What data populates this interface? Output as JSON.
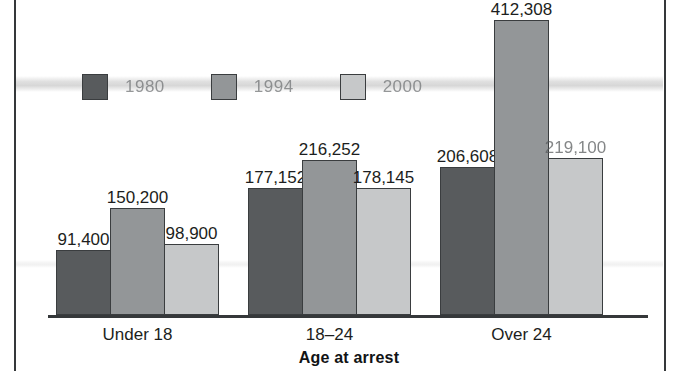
{
  "chart_data": {
    "type": "bar",
    "title": "",
    "subtitle": "",
    "xlabel": "Age at arrest",
    "ylabel": "",
    "categories": [
      "Under 18",
      "18–24",
      "Over 24"
    ],
    "grid": false,
    "legend_position": "top-left",
    "ylim": [
      0,
      412308
    ],
    "axis_max": 412308,
    "series": [
      {
        "name": "1980",
        "color": "#585b5d",
        "values": [
          91400,
          177152,
          206608
        ],
        "labels": [
          "91,400",
          "177,152",
          "206,608"
        ]
      },
      {
        "name": "1994",
        "color": "#939698",
        "values": [
          150200,
          216252,
          412308
        ],
        "labels": [
          "150,200",
          "216,252",
          "412,308"
        ]
      },
      {
        "name": "2000",
        "color": "#c6c8c9",
        "values": [
          98900,
          178145,
          219100
        ],
        "labels": [
          "98,900",
          "178,145",
          "219,100"
        ]
      }
    ]
  },
  "colors": {
    "series_1980": "#585b5d",
    "series_1994": "#939698",
    "series_2000": "#c6c8c9",
    "outline": "#3a3d3f",
    "axis": "#35383a",
    "text": "#1c1e20",
    "background": "#ffffff"
  }
}
